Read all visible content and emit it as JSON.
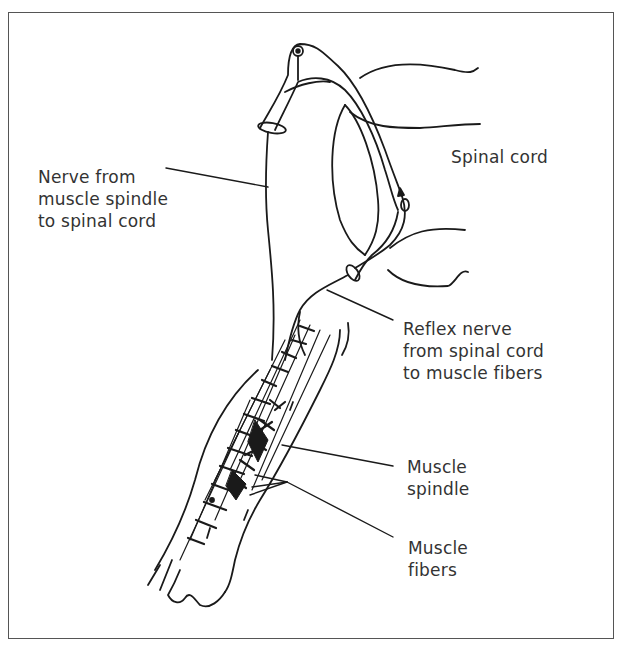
{
  "diagram": {
    "stroke_color": "#1a1a1a",
    "text_color": "#333333",
    "frame_color": "#555555",
    "labels": {
      "nerve_to_cord": [
        "Nerve from",
        "muscle spindle",
        "to spinal cord"
      ],
      "spinal_cord": [
        "Spinal cord"
      ],
      "reflex_nerve": [
        "Reflex nerve",
        "from spinal cord",
        "to muscle fibers"
      ],
      "muscle_spindle": [
        "Muscle",
        "spindle"
      ],
      "muscle_fibers": [
        "Muscle",
        "fibers"
      ]
    }
  }
}
